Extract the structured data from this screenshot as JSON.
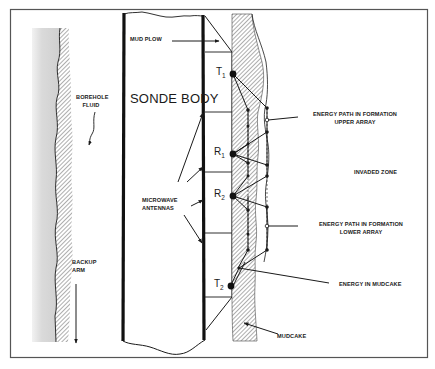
{
  "figure": {
    "labels": {
      "mud_plow": "MUD PLOW",
      "sonde_body": "SONDE BODY",
      "borehole_fluid_line1": "BOREHOLE",
      "borehole_fluid_line2": "FLUID",
      "backup_arm_line1": "BACKUP",
      "backup_arm_line2": "ARM",
      "microwave_antennas_line1": "MICROWAVE",
      "microwave_antennas_line2": "ANTENNAS",
      "energy_upper_line1": "ENERGY PATH IN FORMATION",
      "energy_upper_line2": "UPPER ARRAY",
      "invaded_zone": "INVADED ZONE",
      "energy_lower_line1": "ENERGY PATH IN FORMATION",
      "energy_lower_line2": "LOWER ARRAY",
      "energy_in_mudcake": "ENERGY IN MUDCAKE",
      "mudcake": "MUDCAKE"
    },
    "antennas": [
      {
        "letter": "T",
        "sub": "1"
      },
      {
        "letter": "R",
        "sub": "1"
      },
      {
        "letter": "R",
        "sub": "2"
      },
      {
        "letter": "T",
        "sub": "2"
      }
    ],
    "colors": {
      "ink": "#1a1a1a",
      "frame": "#555555",
      "fluid_gray": "#d4d4d4",
      "hatch": "#6a6a6a"
    }
  }
}
